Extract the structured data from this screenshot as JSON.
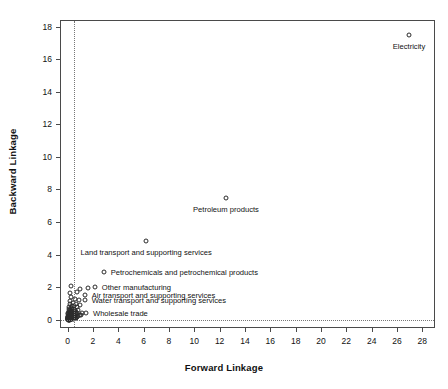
{
  "chart_data": {
    "type": "scatter",
    "title": "",
    "xlabel": "Forward Linkage",
    "ylabel": "Backward Linkage",
    "xlim": [
      -0.6,
      29.0
    ],
    "ylim": [
      -0.5,
      18.4
    ],
    "xticks": [
      0,
      2,
      4,
      6,
      8,
      10,
      12,
      14,
      16,
      18,
      20,
      22,
      24,
      26,
      28
    ],
    "yticks": [
      0,
      2,
      4,
      6,
      8,
      10,
      12,
      14,
      16,
      18
    ],
    "grid": false,
    "reference_lines": [
      {
        "orientation": "vertical",
        "value": 0.5,
        "style": "dotted"
      },
      {
        "orientation": "horizontal",
        "value": 0.0,
        "style": "dotted"
      }
    ],
    "marker": "open-circle",
    "legend": "none",
    "labeled_points": [
      {
        "label": "Electricity",
        "x": 26.95,
        "y": 17.5,
        "label_dx": 0,
        "label_dy": 11,
        "align": "center"
      },
      {
        "label": "Petroleum products",
        "x": 12.5,
        "y": 7.5,
        "label_dx": 0,
        "label_dy": 11,
        "align": "center"
      },
      {
        "label": "Land transport and supporting services",
        "x": 6.2,
        "y": 4.85,
        "label_dx": 0,
        "label_dy": 11,
        "align": "center"
      },
      {
        "label": "Petrochemicals and petrochemical products",
        "x": 2.85,
        "y": 2.95,
        "label_dx": 7,
        "label_dy": 0,
        "align": "left"
      },
      {
        "label": "Other manufacturing",
        "x": 2.15,
        "y": 2.0,
        "label_dx": 7,
        "label_dy": 0,
        "align": "left"
      },
      {
        "label": "Air transport and supporting services",
        "x": 1.35,
        "y": 1.55,
        "label_dx": 7,
        "label_dy": 0,
        "align": "left"
      },
      {
        "label": "Water transport and supporting services",
        "x": 1.35,
        "y": 1.22,
        "label_dx": 7,
        "label_dy": 0,
        "align": "left"
      },
      {
        "label": "Wholesale trade",
        "x": 1.45,
        "y": 0.45,
        "label_dx": 7,
        "label_dy": 0,
        "align": "left"
      }
    ],
    "unlabeled_points": [
      {
        "x": 0.28,
        "y": 2.05
      },
      {
        "x": 0.95,
        "y": 1.88
      },
      {
        "x": 1.62,
        "y": 1.93
      },
      {
        "x": 0.22,
        "y": 1.62
      },
      {
        "x": 0.72,
        "y": 1.7
      },
      {
        "x": 0.3,
        "y": 1.42
      },
      {
        "x": 0.58,
        "y": 1.3
      },
      {
        "x": 0.88,
        "y": 1.2
      },
      {
        "x": 0.18,
        "y": 1.18
      },
      {
        "x": 0.45,
        "y": 1.05
      },
      {
        "x": 0.68,
        "y": 0.98
      },
      {
        "x": 0.95,
        "y": 0.9
      },
      {
        "x": 0.15,
        "y": 0.95
      },
      {
        "x": 0.32,
        "y": 0.88
      },
      {
        "x": 0.52,
        "y": 0.82
      },
      {
        "x": 0.72,
        "y": 0.76
      },
      {
        "x": 0.12,
        "y": 0.8
      },
      {
        "x": 0.26,
        "y": 0.72
      },
      {
        "x": 0.42,
        "y": 0.68
      },
      {
        "x": 0.6,
        "y": 0.62
      },
      {
        "x": 0.8,
        "y": 0.58
      },
      {
        "x": 0.1,
        "y": 0.66
      },
      {
        "x": 0.22,
        "y": 0.6
      },
      {
        "x": 0.36,
        "y": 0.56
      },
      {
        "x": 0.5,
        "y": 0.52
      },
      {
        "x": 0.64,
        "y": 0.48
      },
      {
        "x": 0.78,
        "y": 0.44
      },
      {
        "x": 0.08,
        "y": 0.54
      },
      {
        "x": 0.18,
        "y": 0.5
      },
      {
        "x": 0.28,
        "y": 0.46
      },
      {
        "x": 0.38,
        "y": 0.42
      },
      {
        "x": 0.48,
        "y": 0.4
      },
      {
        "x": 0.58,
        "y": 0.36
      },
      {
        "x": 0.68,
        "y": 0.34
      },
      {
        "x": 0.06,
        "y": 0.44
      },
      {
        "x": 0.14,
        "y": 0.4
      },
      {
        "x": 0.22,
        "y": 0.36
      },
      {
        "x": 0.3,
        "y": 0.33
      },
      {
        "x": 0.38,
        "y": 0.3
      },
      {
        "x": 0.46,
        "y": 0.28
      },
      {
        "x": 0.54,
        "y": 0.26
      },
      {
        "x": 0.62,
        "y": 0.24
      },
      {
        "x": 0.05,
        "y": 0.34
      },
      {
        "x": 0.11,
        "y": 0.31
      },
      {
        "x": 0.17,
        "y": 0.28
      },
      {
        "x": 0.23,
        "y": 0.26
      },
      {
        "x": 0.29,
        "y": 0.24
      },
      {
        "x": 0.35,
        "y": 0.22
      },
      {
        "x": 0.41,
        "y": 0.2
      },
      {
        "x": 0.47,
        "y": 0.19
      },
      {
        "x": 0.53,
        "y": 0.18
      },
      {
        "x": 0.04,
        "y": 0.26
      },
      {
        "x": 0.09,
        "y": 0.24
      },
      {
        "x": 0.14,
        "y": 0.22
      },
      {
        "x": 0.19,
        "y": 0.2
      },
      {
        "x": 0.24,
        "y": 0.19
      },
      {
        "x": 0.29,
        "y": 0.17
      },
      {
        "x": 0.34,
        "y": 0.16
      },
      {
        "x": 0.39,
        "y": 0.15
      },
      {
        "x": 0.44,
        "y": 0.14
      },
      {
        "x": 0.03,
        "y": 0.2
      },
      {
        "x": 0.07,
        "y": 0.18
      },
      {
        "x": 0.11,
        "y": 0.17
      },
      {
        "x": 0.15,
        "y": 0.15
      },
      {
        "x": 0.19,
        "y": 0.14
      },
      {
        "x": 0.23,
        "y": 0.13
      },
      {
        "x": 0.27,
        "y": 0.12
      },
      {
        "x": 0.31,
        "y": 0.11
      },
      {
        "x": 0.35,
        "y": 0.1
      },
      {
        "x": 0.02,
        "y": 0.15
      },
      {
        "x": 0.05,
        "y": 0.14
      },
      {
        "x": 0.08,
        "y": 0.13
      },
      {
        "x": 0.11,
        "y": 0.12
      },
      {
        "x": 0.14,
        "y": 0.11
      },
      {
        "x": 0.17,
        "y": 0.1
      },
      {
        "x": 0.2,
        "y": 0.09
      },
      {
        "x": 0.23,
        "y": 0.08
      },
      {
        "x": 0.26,
        "y": 0.08
      },
      {
        "x": 0.02,
        "y": 0.1
      },
      {
        "x": 0.04,
        "y": 0.09
      },
      {
        "x": 0.06,
        "y": 0.09
      },
      {
        "x": 0.09,
        "y": 0.08
      },
      {
        "x": 0.12,
        "y": 0.07
      },
      {
        "x": 0.15,
        "y": 0.07
      },
      {
        "x": 0.18,
        "y": 0.06
      },
      {
        "x": 0.21,
        "y": 0.06
      },
      {
        "x": 0.25,
        "y": 0.05
      },
      {
        "x": 0.01,
        "y": 0.07
      },
      {
        "x": 0.03,
        "y": 0.06
      },
      {
        "x": 0.05,
        "y": 0.06
      },
      {
        "x": 0.07,
        "y": 0.05
      },
      {
        "x": 0.1,
        "y": 0.05
      },
      {
        "x": 0.13,
        "y": 0.04
      },
      {
        "x": 0.16,
        "y": 0.04
      },
      {
        "x": 0.19,
        "y": 0.03
      },
      {
        "x": 0.22,
        "y": 0.03
      },
      {
        "x": 0.01,
        "y": 0.04
      },
      {
        "x": 0.02,
        "y": 0.03
      },
      {
        "x": 0.04,
        "y": 0.03
      },
      {
        "x": 0.06,
        "y": 0.02
      },
      {
        "x": 0.08,
        "y": 0.02
      },
      {
        "x": 0.1,
        "y": 0.02
      },
      {
        "x": 0.13,
        "y": 0.01
      },
      {
        "x": 0.16,
        "y": 0.01
      },
      {
        "x": 0.3,
        "y": 0.05
      },
      {
        "x": 0.36,
        "y": 0.04
      },
      {
        "x": 0.42,
        "y": 0.06
      },
      {
        "x": 0.5,
        "y": 0.08
      },
      {
        "x": 0.56,
        "y": 0.1
      },
      {
        "x": 0.63,
        "y": 0.12
      },
      {
        "x": 0.7,
        "y": 0.14
      },
      {
        "x": 0.78,
        "y": 0.18
      },
      {
        "x": 0.86,
        "y": 0.22
      },
      {
        "x": 0.95,
        "y": 0.28
      },
      {
        "x": 1.05,
        "y": 0.32
      },
      {
        "x": 1.15,
        "y": 0.4
      }
    ]
  }
}
